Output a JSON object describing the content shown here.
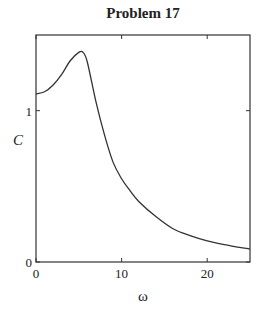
{
  "chart_data": {
    "type": "line",
    "title": "Problem 17",
    "xlabel": "ω",
    "ylabel": "C",
    "xlim": [
      0,
      25
    ],
    "ylim": [
      0,
      1.5
    ],
    "xticks": [
      0,
      10,
      20
    ],
    "yticks": [
      0,
      1
    ],
    "grid": false,
    "legend": null,
    "series": [
      {
        "name": "C(ω)",
        "x": [
          0,
          1,
          2,
          3,
          4,
          5,
          5.5,
          6,
          7,
          8,
          9,
          10,
          11,
          12,
          14,
          16,
          18,
          20,
          22,
          25
        ],
        "y": [
          1.11,
          1.125,
          1.17,
          1.24,
          1.33,
          1.385,
          1.385,
          1.32,
          1.06,
          0.84,
          0.66,
          0.55,
          0.47,
          0.4,
          0.3,
          0.22,
          0.175,
          0.14,
          0.115,
          0.085
        ]
      }
    ]
  }
}
